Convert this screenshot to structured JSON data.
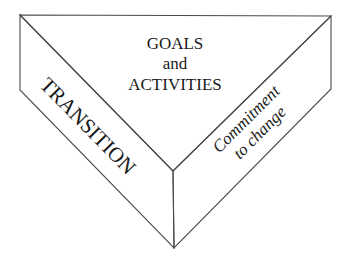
{
  "diagram": {
    "type": "three-faced-prism",
    "faces": {
      "top": {
        "lines": [
          "GOALS",
          "and",
          "ACTIVITIES"
        ]
      },
      "left": {
        "label": "TRANSITION"
      },
      "right": {
        "lines": [
          "Commitment",
          "to change"
        ]
      }
    },
    "colors": {
      "edge": "#4a4a4a",
      "text": "#1a1a1a",
      "background": "#ffffff"
    }
  }
}
